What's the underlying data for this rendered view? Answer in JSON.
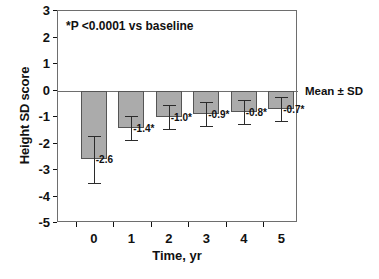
{
  "chart_data": {
    "type": "bar",
    "title": "",
    "subtitle": "",
    "xlabel": "Time, yr",
    "ylabel": "Height SD score",
    "categories": [
      "0",
      "1",
      "2",
      "3",
      "4",
      "5"
    ],
    "x": [
      0,
      1,
      2,
      3,
      4,
      5
    ],
    "values": [
      -2.6,
      -1.4,
      -1.0,
      -0.9,
      -0.8,
      -0.7
    ],
    "errors": [
      0.9,
      0.45,
      0.45,
      0.45,
      0.45,
      0.45
    ],
    "point_labels": [
      "-2.6",
      "-1.4*",
      "-1.0*",
      "-0.9*",
      "-0.8*",
      "-0.7*"
    ],
    "ylim": [
      -5,
      3
    ],
    "yticks": [
      3,
      2,
      1,
      0,
      -1,
      -2,
      -3,
      -4,
      -5
    ],
    "ytick_labels": [
      "3",
      "2",
      "1",
      "0",
      "-1",
      "-2",
      "-3",
      "-4",
      "-5"
    ],
    "xlim": [
      -0.5,
      5.9
    ],
    "xticks": [
      0,
      1,
      2,
      3,
      4,
      5
    ],
    "xtick_labels": [
      "0",
      "1",
      "2",
      "3",
      "4",
      "5"
    ],
    "grid": false,
    "legend_position": "right-outside",
    "annotations": [
      {
        "name": "significance-note",
        "text": "*P <0.0001 vs baseline",
        "position": "inside-top-left"
      },
      {
        "name": "error-definition",
        "text": "Mean ± SD",
        "position": "outside-right"
      }
    ],
    "colors": {
      "bar_fill": "#ababab",
      "bar_edge": "#555555",
      "error_bar": "#2b2b2b",
      "axis": "#6e6e6e",
      "text": "#111111",
      "background": "#ffffff"
    }
  },
  "axes": {
    "y_title": "Height SD score",
    "x_title": "Time, yr"
  },
  "notes": {
    "significance": "*P <0.0001 vs baseline",
    "error_definition": "Mean ± SD"
  }
}
